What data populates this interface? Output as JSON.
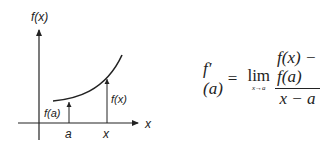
{
  "graph": {
    "y_axis_label": "f(x)",
    "x_axis_label": "x",
    "point_a_label": "a",
    "point_x_label": "x",
    "value_at_a_label": "f(a)",
    "value_at_x_label": "f(x)"
  },
  "formula": {
    "lhs": "f′(a)",
    "equals": "=",
    "lim_word": "lim",
    "lim_sub": "x→a",
    "numerator": "f(x) − f(a)",
    "denominator": "x − a"
  }
}
